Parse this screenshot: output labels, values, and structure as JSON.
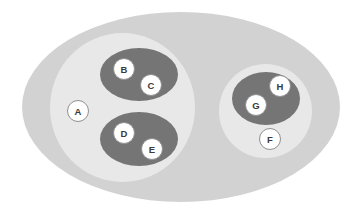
{
  "diagram": {
    "type": "nested-set-diagram",
    "title": "",
    "canvas": {
      "width": 362,
      "height": 214,
      "background": "#ffffff"
    },
    "palette": {
      "outer_set_fill": "#d2d2d2",
      "inner_set_fill": "#e8e8e8",
      "leaf_set_fill": "#757575",
      "node_fill": "#ffffff",
      "node_stroke": "#909090",
      "node_text": "#3a3a3a"
    },
    "sets": [
      {
        "id": "outer",
        "name": "outer-set",
        "level": 0,
        "fill": "#d2d2d2",
        "cx": 181,
        "cy": 107,
        "rx": 159,
        "ry": 95
      },
      {
        "id": "left-group",
        "name": "left-inner-set",
        "level": 1,
        "fill": "#e8e8e8",
        "cx": 122.5,
        "cy": 107.5,
        "rx": 72.5,
        "ry": 74.5
      },
      {
        "id": "right-group",
        "name": "right-inner-set",
        "level": 1,
        "fill": "#e8e8e8",
        "cx": 265.5,
        "cy": 111,
        "rx": 46.5,
        "ry": 47
      },
      {
        "id": "bc-group",
        "name": "leaf-set-bc",
        "level": 2,
        "fill": "#757575",
        "cx": 139,
        "cy": 74.5,
        "rx": 39,
        "ry": 26.5
      },
      {
        "id": "de-group",
        "name": "leaf-set-de",
        "level": 2,
        "fill": "#757575",
        "cx": 139,
        "cy": 139,
        "rx": 39,
        "ry": 27
      },
      {
        "id": "gh-group",
        "name": "leaf-set-gh",
        "level": 2,
        "fill": "#757575",
        "cx": 266,
        "cy": 98.5,
        "rx": 34,
        "ry": 26.5
      }
    ],
    "nodes": [
      {
        "id": "A",
        "label": "A",
        "cx": 78,
        "cy": 111,
        "r": 10.5,
        "parent": "left-group"
      },
      {
        "id": "B",
        "label": "B",
        "cx": 124,
        "cy": 69,
        "r": 10.5,
        "parent": "bc-group"
      },
      {
        "id": "C",
        "label": "C",
        "cx": 151,
        "cy": 85,
        "r": 10.5,
        "parent": "bc-group"
      },
      {
        "id": "D",
        "label": "D",
        "cx": 124,
        "cy": 133,
        "r": 10.5,
        "parent": "de-group"
      },
      {
        "id": "E",
        "label": "E",
        "cx": 152,
        "cy": 149,
        "r": 10.5,
        "parent": "de-group"
      },
      {
        "id": "F",
        "label": "F",
        "cx": 270,
        "cy": 139,
        "r": 10.5,
        "parent": "right-group"
      },
      {
        "id": "G",
        "label": "G",
        "cx": 256,
        "cy": 105,
        "r": 10.5,
        "parent": "gh-group"
      },
      {
        "id": "H",
        "label": "H",
        "cx": 280,
        "cy": 86,
        "r": 10.5,
        "parent": "gh-group"
      }
    ]
  }
}
